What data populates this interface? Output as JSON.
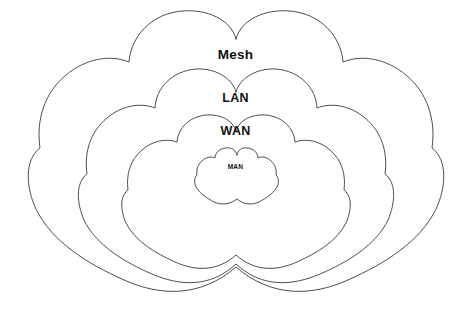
{
  "diagram": {
    "type": "nested-cloud-venn",
    "background_color": "#ffffff",
    "stroke_color": "#3a3a3a",
    "fill_color": "#ffffff",
    "layers": [
      {
        "id": "mesh",
        "label": "Mesh",
        "level": 1,
        "scope": "outermost",
        "label_position": "top",
        "font_size_px": 13.5
      },
      {
        "id": "lan",
        "label": "LAN",
        "level": 2,
        "scope": "second",
        "label_position": "top",
        "font_size_px": 12.5
      },
      {
        "id": "wan",
        "label": "WAN",
        "level": 3,
        "scope": "third",
        "label_position": "top",
        "font_size_px": 12.5
      },
      {
        "id": "man",
        "label": "MAN",
        "level": 4,
        "scope": "innermost",
        "label_position": "center",
        "font_size_px": 6.5
      }
    ]
  }
}
